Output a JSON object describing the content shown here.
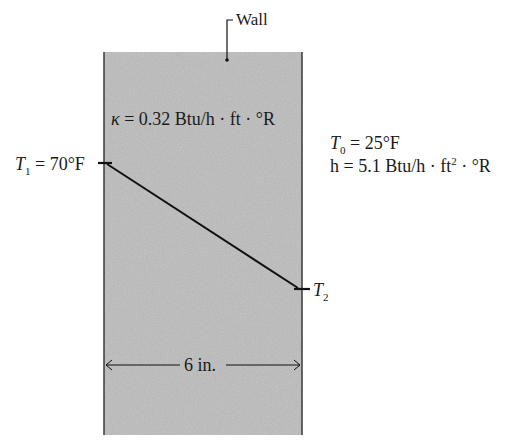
{
  "figure": {
    "wall_label": "Wall",
    "conductivity": {
      "symbol": "κ",
      "text": " = 0.32 Btu/h · ft · °R"
    },
    "inner_temp": {
      "symbol": "T",
      "subscript": "1",
      "text": " = 70°F"
    },
    "outer_temp": {
      "symbol": "T",
      "subscript": "2"
    },
    "ambient_temp": {
      "symbol": "T",
      "subscript": "0",
      "text": " = 25°F"
    },
    "convection": {
      "prefix": "h = 5.1 Btu/h · ft",
      "superscript": "2",
      "suffix": " · °R"
    },
    "thickness": "6 in.",
    "colors": {
      "wall_fill": "#b4b4b4",
      "wall_edge": "#3a3a3a",
      "line": "#111111"
    }
  }
}
